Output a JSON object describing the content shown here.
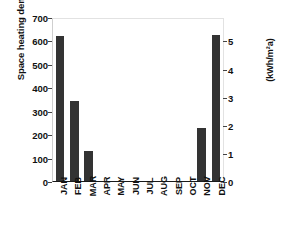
{
  "chart_data": {
    "type": "bar",
    "title": "",
    "categories": [
      "JAN",
      "FEB",
      "MAR",
      "APR",
      "MAY",
      "JUN",
      "JUL",
      "AUG",
      "SEP",
      "OCT",
      "NOV",
      "DEC"
    ],
    "values": [
      620,
      342,
      128,
      0,
      0,
      0,
      0,
      0,
      0,
      0,
      225,
      622
    ],
    "series": [
      {
        "name": "Space heating demand",
        "values": [
          620,
          342,
          128,
          0,
          0,
          0,
          0,
          0,
          0,
          0,
          225,
          622
        ]
      }
    ],
    "xlabel": "",
    "ylabel": "Space heating demand (kWh/a)",
    "ylabel_right": "(kWh/m²a)",
    "ylim": [
      0,
      700
    ],
    "yticks": [
      0,
      100,
      200,
      300,
      400,
      500,
      600,
      700
    ],
    "ytick_labels": [
      "0",
      "100",
      "200",
      "300",
      "400",
      "500",
      "600",
      "700"
    ],
    "ylim_right": [
      0,
      5.833
    ],
    "yticks_right": [
      0,
      1,
      2,
      3,
      4,
      5
    ],
    "ytick_labels_right": [
      "0",
      "1",
      "2",
      "3",
      "4",
      "5"
    ],
    "grid": false,
    "legend": "none",
    "bar_color": "#333333",
    "plot_background": "#ffffff",
    "axis_color": "#1a1a1a"
  }
}
